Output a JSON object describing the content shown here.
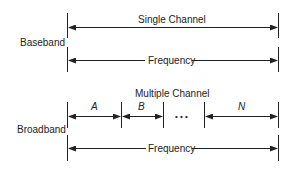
{
  "baseband": {
    "label": "Baseband",
    "channel_label": "Single Channel",
    "frequency_label": "Frequency"
  },
  "broadband": {
    "label": "Broadband",
    "channel_label": "Multiple Channel",
    "channels": [
      "A",
      "B",
      "N"
    ],
    "ellipsis": "• • •",
    "frequency_label": "Frequency"
  }
}
